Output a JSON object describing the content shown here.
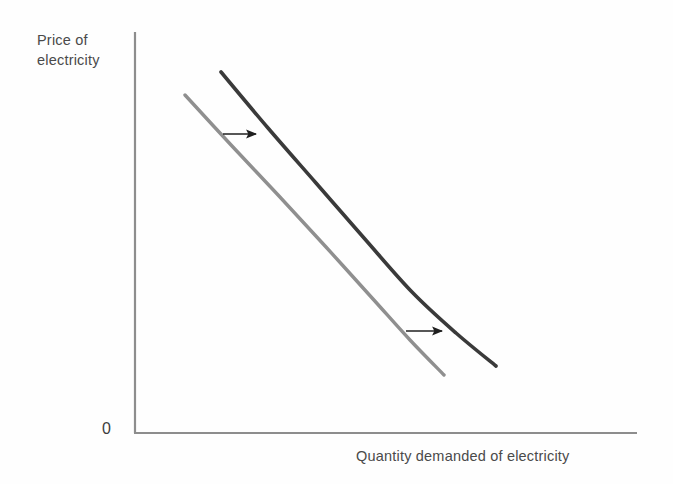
{
  "figure": {
    "title": "",
    "background_color": "#fefefe",
    "text_color": "#4a4a4a"
  },
  "axes": {
    "y_label_line1": "Price of",
    "y_label_line2": "electricity",
    "y_label": "Price of electricity",
    "x_label": "Quantity demanded of electricity",
    "origin_label": "0",
    "axis_color": "#8d8d8d",
    "y_axis": {
      "x": 135,
      "y_top": 32,
      "y_bottom": 433
    },
    "x_axis": {
      "y": 433,
      "x_left": 135,
      "x_right": 637
    }
  },
  "chart_data": {
    "type": "line",
    "title": "",
    "xlabel": "Quantity demanded of electricity",
    "ylabel": "Price of electricity",
    "grid": false,
    "legend": "none",
    "axis_ticks": {
      "x": [],
      "y": []
    },
    "xlim": [
      0,
      100
    ],
    "ylim": [
      0,
      100
    ],
    "note": "Downward-sloping demand curve shifting rightward (increase in demand for electricity)",
    "series": [
      {
        "name": "Original demand curve",
        "color": "#8f8f8f",
        "linewidth": 3.4,
        "points": [
          {
            "x": 185,
            "y": 95
          },
          {
            "x": 232,
            "y": 146
          },
          {
            "x": 279,
            "y": 196
          },
          {
            "x": 326,
            "y": 247
          },
          {
            "x": 373,
            "y": 299
          },
          {
            "x": 410,
            "y": 340
          },
          {
            "x": 444,
            "y": 375
          }
        ]
      },
      {
        "name": "New demand curve",
        "color": "#3a3a3a",
        "linewidth": 3.6,
        "points": [
          {
            "x": 221,
            "y": 72
          },
          {
            "x": 268,
            "y": 128
          },
          {
            "x": 316,
            "y": 183
          },
          {
            "x": 364,
            "y": 238
          },
          {
            "x": 412,
            "y": 292
          },
          {
            "x": 456,
            "y": 333
          },
          {
            "x": 496,
            "y": 366
          }
        ]
      }
    ],
    "annotations": [
      {
        "name": "shift-arrow-upper",
        "type": "arrow",
        "direction": "right",
        "x1": 223,
        "y1": 134,
        "x2": 256,
        "y2": 134,
        "color": "#1f1f1f"
      },
      {
        "name": "shift-arrow-lower",
        "type": "arrow",
        "direction": "right",
        "x1": 406,
        "y1": 331,
        "x2": 442,
        "y2": 331,
        "color": "#1f1f1f"
      }
    ]
  }
}
